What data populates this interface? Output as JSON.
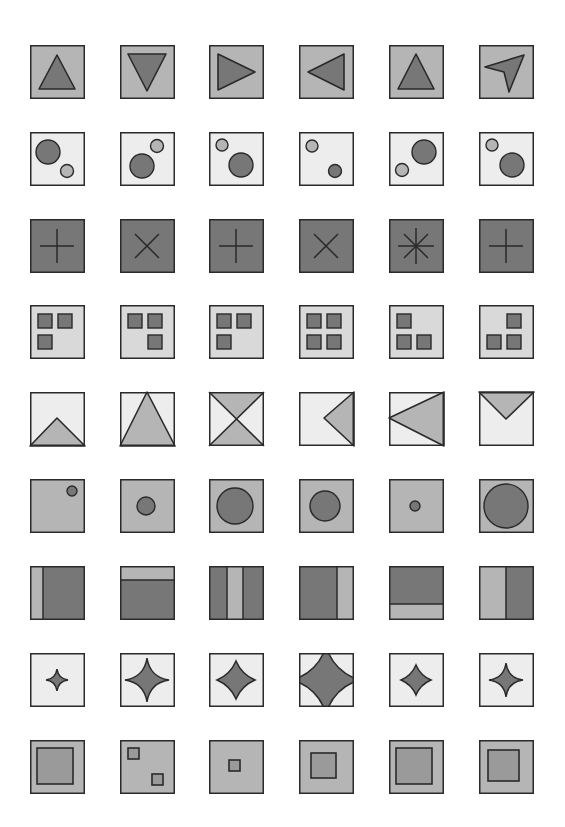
{
  "colors": {
    "dark": "#777777",
    "mid": "#b5b5b5",
    "light": "#ededed",
    "stroke": "#2a2a2a"
  },
  "layout": {
    "col_x": [
      30,
      120,
      209,
      299,
      389,
      479
    ],
    "row_y": [
      45,
      132,
      219,
      305,
      392,
      479,
      566,
      653,
      740
    ],
    "tile_size": 55
  },
  "rows": [
    {
      "name": "triangles",
      "bg": "mid",
      "tiles": [
        {
          "type": "poly",
          "pts": [
            [
              27,
              10
            ],
            [
              45,
              44
            ],
            [
              9,
              44
            ]
          ],
          "fill": "dark"
        },
        {
          "type": "poly",
          "pts": [
            [
              8,
              9
            ],
            [
              46,
              9
            ],
            [
              27,
              46
            ]
          ],
          "fill": "dark"
        },
        {
          "type": "poly",
          "pts": [
            [
              9,
              9
            ],
            [
              46,
              27
            ],
            [
              9,
              45
            ]
          ],
          "fill": "dark"
        },
        {
          "type": "poly",
          "pts": [
            [
              45,
              9
            ],
            [
              9,
              27
            ],
            [
              45,
              45
            ]
          ],
          "fill": "dark"
        },
        {
          "type": "poly",
          "pts": [
            [
              27,
              9
            ],
            [
              45,
              44
            ],
            [
              9,
              44
            ]
          ],
          "fill": "dark"
        },
        {
          "type": "poly",
          "pts": [
            [
              45,
              10
            ],
            [
              6,
              22
            ],
            [
              25,
              27
            ],
            [
              30,
              47
            ]
          ],
          "fill": "dark"
        }
      ]
    },
    {
      "name": "two-circles",
      "bg": "light",
      "tiles": [
        {
          "type": "circles",
          "items": [
            {
              "cx": 18,
              "cy": 20,
              "r": 12,
              "fill": "dark"
            },
            {
              "cx": 37,
              "cy": 39,
              "r": 6.5,
              "fill": "mid"
            }
          ]
        },
        {
          "type": "circles",
          "items": [
            {
              "cx": 22,
              "cy": 34,
              "r": 12,
              "fill": "dark"
            },
            {
              "cx": 37,
              "cy": 14,
              "r": 6.5,
              "fill": "mid"
            }
          ]
        },
        {
          "type": "circles",
          "items": [
            {
              "cx": 32,
              "cy": 33,
              "r": 12,
              "fill": "dark"
            },
            {
              "cx": 13,
              "cy": 13,
              "r": 6,
              "fill": "mid"
            }
          ]
        },
        {
          "type": "circles",
          "items": [
            {
              "cx": 13,
              "cy": 14,
              "r": 6,
              "fill": "mid"
            },
            {
              "cx": 36,
              "cy": 39,
              "r": 6.5,
              "fill": "dark"
            }
          ]
        },
        {
          "type": "circles",
          "items": [
            {
              "cx": 35,
              "cy": 20,
              "r": 12,
              "fill": "dark"
            },
            {
              "cx": 13,
              "cy": 38,
              "r": 6.5,
              "fill": "mid"
            }
          ]
        },
        {
          "type": "circles",
          "items": [
            {
              "cx": 13,
              "cy": 13,
              "r": 6,
              "fill": "mid"
            },
            {
              "cx": 33,
              "cy": 33,
              "r": 12,
              "fill": "dark"
            }
          ]
        }
      ]
    },
    {
      "name": "crosses",
      "bg": "dark",
      "tiles": [
        {
          "type": "lines",
          "segs": [
            [
              10,
              27,
              44,
              27
            ],
            [
              27,
              10,
              27,
              44
            ]
          ]
        },
        {
          "type": "lines",
          "segs": [
            [
              15,
              15,
              39,
              39
            ],
            [
              39,
              15,
              15,
              39
            ]
          ]
        },
        {
          "type": "lines",
          "segs": [
            [
              10,
              27,
              44,
              27
            ],
            [
              27,
              10,
              27,
              44
            ]
          ]
        },
        {
          "type": "lines",
          "segs": [
            [
              15,
              15,
              39,
              39
            ],
            [
              39,
              15,
              15,
              39
            ]
          ]
        },
        {
          "type": "lines",
          "segs": [
            [
              9,
              27,
              45,
              27
            ],
            [
              27,
              9,
              27,
              45
            ],
            [
              15,
              15,
              39,
              39
            ],
            [
              39,
              15,
              15,
              39
            ]
          ]
        },
        {
          "type": "lines",
          "segs": [
            [
              10,
              27,
              44,
              27
            ],
            [
              27,
              10,
              27,
              44
            ]
          ]
        }
      ]
    },
    {
      "name": "small-squares",
      "bg": "light-mid",
      "tiles": [
        {
          "type": "squares",
          "items": [
            [
              8,
              9
            ],
            [
              28,
              9
            ],
            [
              8,
              30
            ]
          ]
        },
        {
          "type": "squares",
          "items": [
            [
              8,
              9
            ],
            [
              28,
              9
            ],
            [
              28,
              30
            ]
          ]
        },
        {
          "type": "squares",
          "items": [
            [
              8,
              9
            ],
            [
              28,
              9
            ],
            [
              8,
              30
            ]
          ]
        },
        {
          "type": "squares",
          "items": [
            [
              8,
              9
            ],
            [
              28,
              9
            ],
            [
              8,
              30
            ],
            [
              28,
              30
            ]
          ]
        },
        {
          "type": "squares",
          "items": [
            [
              8,
              9
            ],
            [
              8,
              30
            ],
            [
              28,
              30
            ]
          ]
        },
        {
          "type": "squares",
          "items": [
            [
              28,
              9
            ],
            [
              8,
              30
            ],
            [
              28,
              30
            ]
          ]
        }
      ]
    },
    {
      "name": "line-triangles",
      "bg": "light",
      "tiles": [
        {
          "type": "poly",
          "pts": [
            [
              0,
              54
            ],
            [
              27,
              26
            ],
            [
              55,
              54
            ]
          ],
          "fill": "mid"
        },
        {
          "type": "poly",
          "pts": [
            [
              0,
              54
            ],
            [
              27,
              0
            ],
            [
              55,
              54
            ]
          ],
          "fill": "mid"
        },
        {
          "type": "hourglass"
        },
        {
          "type": "poly",
          "pts": [
            [
              55,
              0
            ],
            [
              25,
              26
            ],
            [
              55,
              54
            ]
          ],
          "fill": "mid"
        },
        {
          "type": "poly",
          "pts": [
            [
              55,
              0
            ],
            [
              0,
              26
            ],
            [
              55,
              54
            ]
          ],
          "fill": "mid"
        },
        {
          "type": "poly",
          "pts": [
            [
              0,
              0
            ],
            [
              27,
              27
            ],
            [
              55,
              0
            ]
          ],
          "fill": "mid"
        }
      ]
    },
    {
      "name": "single-circle",
      "bg": "mid",
      "tiles": [
        {
          "type": "circles",
          "items": [
            {
              "cx": 42,
              "cy": 12,
              "r": 5,
              "fill": "dark"
            }
          ]
        },
        {
          "type": "circles",
          "items": [
            {
              "cx": 26,
              "cy": 27,
              "r": 9,
              "fill": "dark"
            }
          ]
        },
        {
          "type": "circles",
          "items": [
            {
              "cx": 26,
              "cy": 27,
              "r": 18,
              "fill": "dark"
            }
          ]
        },
        {
          "type": "circles",
          "items": [
            {
              "cx": 26,
              "cy": 27,
              "r": 15,
              "fill": "dark"
            }
          ]
        },
        {
          "type": "circles",
          "items": [
            {
              "cx": 26,
              "cy": 27,
              "r": 5,
              "fill": "dark"
            }
          ]
        },
        {
          "type": "circles",
          "items": [
            {
              "cx": 27,
              "cy": 27,
              "r": 22,
              "fill": "dark"
            }
          ]
        }
      ]
    },
    {
      "name": "bands",
      "bg": "dark",
      "tiles": [
        {
          "type": "rects",
          "items": [
            [
              0,
              0,
              13,
              54,
              "mid"
            ]
          ],
          "dividers": [
            [
              13,
              0,
              13,
              54
            ]
          ]
        },
        {
          "type": "rects",
          "items": [
            [
              0,
              0,
              55,
              14,
              "mid"
            ]
          ],
          "dividers": [
            [
              0,
              14,
              55,
              14
            ]
          ]
        },
        {
          "type": "rects",
          "items": [
            [
              18,
              0,
              16,
              54,
              "mid"
            ]
          ],
          "dividers": [
            [
              18,
              0,
              18,
              54
            ],
            [
              34,
              0,
              34,
              54
            ]
          ]
        },
        {
          "type": "rects",
          "items": [
            [
              38,
              0,
              17,
              54,
              "mid"
            ]
          ],
          "dividers": [
            [
              38,
              0,
              38,
              54
            ]
          ]
        },
        {
          "type": "rects",
          "items": [
            [
              0,
              38,
              55,
              16,
              "mid"
            ]
          ],
          "dividers": [
            [
              0,
              38,
              55,
              38
            ]
          ]
        },
        {
          "type": "rects",
          "items": [
            [
              0,
              0,
              27,
              54,
              "mid"
            ]
          ],
          "dividers": [
            [
              27,
              0,
              27,
              54
            ]
          ]
        }
      ]
    },
    {
      "name": "stars",
      "bg": "light",
      "tiles": [
        {
          "type": "astroid",
          "cx": 27,
          "cy": 27,
          "rx": 11,
          "ry": 11,
          "k": 0.15
        },
        {
          "type": "astroid",
          "cx": 27,
          "cy": 27,
          "rx": 22,
          "ry": 22,
          "k": 0.18
        },
        {
          "type": "astroid",
          "cx": 27,
          "cy": 27,
          "rx": 19,
          "ry": 19,
          "k": 0.55
        },
        {
          "type": "astroid",
          "cx": 27,
          "cy": 27,
          "rx": 33,
          "ry": 33,
          "k": 0.45
        },
        {
          "type": "astroid",
          "cx": 27,
          "cy": 27,
          "rx": 15,
          "ry": 15,
          "k": 0.55
        },
        {
          "type": "astroid",
          "cx": 27,
          "cy": 27,
          "rx": 17,
          "ry": 17,
          "k": 0.15
        }
      ]
    },
    {
      "name": "nested-squares",
      "bg": "mid",
      "tiles": [
        {
          "type": "insquares",
          "items": [
            [
              7,
              8,
              36,
              36
            ]
          ]
        },
        {
          "type": "insquares",
          "items": [
            [
              8,
              8,
              11,
              11
            ],
            [
              32,
              34,
              11,
              11
            ]
          ]
        },
        {
          "type": "insquares",
          "items": [
            [
              20,
              20,
              11,
              11
            ]
          ]
        },
        {
          "type": "insquares",
          "items": [
            [
              12,
              13,
              25,
              25
            ]
          ]
        },
        {
          "type": "insquares",
          "items": [
            [
              7,
              8,
              36,
              36
            ]
          ]
        },
        {
          "type": "insquares",
          "items": [
            [
              9,
              10,
              31,
              31
            ]
          ]
        }
      ]
    }
  ]
}
